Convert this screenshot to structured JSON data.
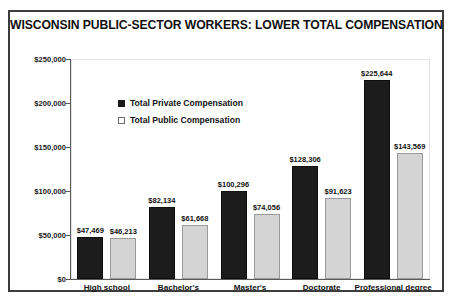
{
  "chart_data": {
    "type": "bar",
    "title": "WISCONSIN PUBLIC-SECTOR WORKERS: LOWER TOTAL COMPENSATION",
    "categories": [
      "High school",
      "Bachelor's",
      "Master's",
      "Doctorate",
      "Professional degree"
    ],
    "series": [
      {
        "name": "Total Private Compensation",
        "color": "#1c1c1c",
        "values": [
          47469,
          82134,
          100296,
          128306,
          225644
        ],
        "labels": [
          "$47,469",
          "$82,134",
          "$100,296",
          "$128,306",
          "$225,644"
        ]
      },
      {
        "name": "Total Public Compensation",
        "color": "#d4d4d4",
        "values": [
          46213,
          61668,
          74056,
          91623,
          143569
        ],
        "labels": [
          "$46,213",
          "$61,668",
          "$74,056",
          "$91,623",
          "$143,569"
        ]
      }
    ],
    "xlabel": "",
    "ylabel": "",
    "ylim": [
      0,
      250000
    ],
    "ytick_values": [
      0,
      50000,
      100000,
      150000,
      200000,
      250000
    ],
    "ytick_labels": [
      "$0",
      "$50,000",
      "$100,000",
      "$150,000",
      "$200,000",
      "$250,000"
    ],
    "grid": false,
    "legend_position": "upper-left-inside"
  }
}
